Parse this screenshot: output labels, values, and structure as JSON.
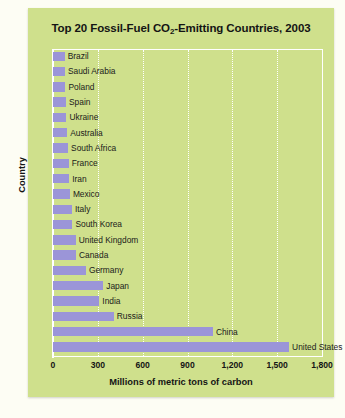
{
  "figure": {
    "title_main": "Top 20 Fossil-Fuel CO",
    "title_sub": "2",
    "title_tail": "-Emitting Countries, 2003",
    "title_full": "Top 20 Fossil-Fuel CO2-Emitting Countries, 2003",
    "background_color": "#cfe08c",
    "bar_color": "#9b95d8",
    "grid_color": "#ffffff",
    "text_color": "#141414"
  },
  "chart_data": {
    "type": "bar",
    "orientation": "horizontal",
    "title": "Top 20 Fossil-Fuel CO2-Emitting Countries, 2003",
    "xlabel": "Millions of metric tons of carbon",
    "ylabel": "Country",
    "xlim": [
      0,
      1800
    ],
    "xticks": [
      0,
      300,
      600,
      900,
      1200,
      1500,
      1800
    ],
    "xticklabels": [
      "0",
      "300",
      "600",
      "900",
      "1,200",
      "1,500",
      "1,800"
    ],
    "grid": true,
    "grid_axis": "x",
    "legend": false,
    "units": "millions of metric tons of carbon",
    "categories": [
      "Brazil",
      "Saudi Arabia",
      "Poland",
      "Spain",
      "Ukraine",
      "Australia",
      "South Africa",
      "France",
      "Iran",
      "Mexico",
      "Italy",
      "South Korea",
      "United Kingdom",
      "Canada",
      "Germany",
      "Japan",
      "India",
      "Russia",
      "China",
      "United States"
    ],
    "values": [
      78,
      80,
      83,
      87,
      90,
      95,
      101,
      105,
      108,
      113,
      127,
      130,
      152,
      154,
      220,
      336,
      310,
      407,
      1070,
      1580
    ]
  }
}
